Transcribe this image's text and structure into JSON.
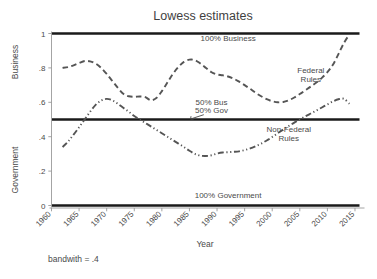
{
  "chart_data": {
    "type": "line",
    "title": "Lowess estimates",
    "xlabel": "Year",
    "ylabel_upper": "Business",
    "ylabel_lower": "Government",
    "footnote": "bandwith = .4",
    "xlim": [
      1960,
      2016
    ],
    "ylim": [
      0,
      1
    ],
    "grid": false,
    "legend_position": "inline-annotations",
    "xticks": [
      "1960",
      "1965",
      "1970",
      "1975",
      "1980",
      "1985",
      "1990",
      "1995",
      "2000",
      "2005",
      "2010",
      "2015"
    ],
    "xtick_values": [
      1960,
      1965,
      1970,
      1975,
      1980,
      1985,
      1990,
      1995,
      2000,
      2005,
      2010,
      2015
    ],
    "yticks": [
      "0",
      ".2",
      ".4",
      ".6",
      ".8",
      "1"
    ],
    "ytick_values": [
      0,
      0.2,
      0.4,
      0.6,
      0.8,
      1
    ],
    "reference_lines": [
      {
        "label": "100% Business",
        "value": 1,
        "style": "solid-black",
        "label_x": 1992,
        "label_y": 0.955
      },
      {
        "label": "50% Bus",
        "value": 0.5,
        "style": "solid-black",
        "label_x": 1989,
        "label_y": 0.585
      },
      {
        "label": "50% Gov",
        "value": 0.5,
        "style": "solid-black",
        "label_x": 1989,
        "label_y": 0.535
      },
      {
        "label": "100% Government",
        "value": 0,
        "style": "solid-black",
        "label_x": 1992,
        "label_y": 0.045
      }
    ],
    "series": [
      {
        "name": "Federal Rules",
        "style": "dashed",
        "label_x": 2007,
        "label_y_line1": 0.77,
        "label_y_line2": 0.72,
        "x": [
          1962,
          1963,
          1964,
          1965,
          1966,
          1967,
          1968,
          1969,
          1970,
          1971,
          1972,
          1973,
          1974,
          1975,
          1976,
          1977,
          1978,
          1979,
          1980,
          1981,
          1982,
          1983,
          1984,
          1985,
          1986,
          1987,
          1988,
          1989,
          1990,
          1991,
          1992,
          1993,
          1994,
          1995,
          1996,
          1997,
          1998,
          1999,
          2000,
          2001,
          2002,
          2003,
          2004,
          2005,
          2006,
          2007,
          2008,
          2009,
          2010,
          2011,
          2012,
          2013,
          2014
        ],
        "y": [
          0.8,
          0.805,
          0.815,
          0.828,
          0.84,
          0.838,
          0.825,
          0.8,
          0.765,
          0.725,
          0.685,
          0.65,
          0.635,
          0.632,
          0.634,
          0.63,
          0.612,
          0.625,
          0.665,
          0.715,
          0.765,
          0.805,
          0.835,
          0.848,
          0.845,
          0.825,
          0.8,
          0.775,
          0.762,
          0.757,
          0.75,
          0.738,
          0.72,
          0.7,
          0.678,
          0.655,
          0.635,
          0.618,
          0.606,
          0.6,
          0.602,
          0.612,
          0.628,
          0.648,
          0.67,
          0.692,
          0.715,
          0.742,
          0.775,
          0.818,
          0.88,
          0.945,
          0.995
        ]
      },
      {
        "name": "Non-Federal Rules",
        "style": "dash-dot-dot",
        "label_x": 2003,
        "label_y_line1": 0.425,
        "label_y_line2": 0.375,
        "x": [
          1962,
          1963,
          1964,
          1965,
          1966,
          1967,
          1968,
          1969,
          1970,
          1971,
          1972,
          1973,
          1974,
          1975,
          1976,
          1977,
          1978,
          1979,
          1980,
          1981,
          1982,
          1983,
          1984,
          1985,
          1986,
          1987,
          1988,
          1989,
          1990,
          1991,
          1992,
          1993,
          1994,
          1995,
          1996,
          1997,
          1998,
          1999,
          2000,
          2001,
          2002,
          2003,
          2004,
          2005,
          2006,
          2007,
          2008,
          2009,
          2010,
          2011,
          2012,
          2013,
          2014
        ],
        "y": [
          0.34,
          0.372,
          0.412,
          0.455,
          0.5,
          0.545,
          0.585,
          0.61,
          0.62,
          0.612,
          0.592,
          0.568,
          0.545,
          0.52,
          0.5,
          0.48,
          0.46,
          0.44,
          0.42,
          0.4,
          0.38,
          0.36,
          0.34,
          0.318,
          0.3,
          0.29,
          0.288,
          0.292,
          0.302,
          0.308,
          0.31,
          0.312,
          0.315,
          0.322,
          0.332,
          0.345,
          0.36,
          0.378,
          0.398,
          0.42,
          0.442,
          0.462,
          0.482,
          0.5,
          0.518,
          0.535,
          0.552,
          0.57,
          0.588,
          0.605,
          0.618,
          0.62,
          0.592
        ]
      }
    ]
  }
}
